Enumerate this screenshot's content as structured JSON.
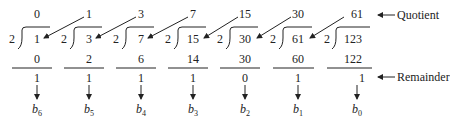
{
  "divisor": "2",
  "columns": [
    {
      "quotient": "0",
      "dividend": "1",
      "product": "0",
      "remainder": "1",
      "bit": "b",
      "bit_sub": "6"
    },
    {
      "quotient": "1",
      "dividend": "3",
      "product": "2",
      "remainder": "1",
      "bit": "b",
      "bit_sub": "5"
    },
    {
      "quotient": "3",
      "dividend": "7",
      "product": "6",
      "remainder": "1",
      "bit": "b",
      "bit_sub": "4"
    },
    {
      "quotient": "7",
      "dividend": "15",
      "product": "14",
      "remainder": "1",
      "bit": "b",
      "bit_sub": "3"
    },
    {
      "quotient": "15",
      "dividend": "30",
      "product": "30",
      "remainder": "0",
      "bit": "b",
      "bit_sub": "2"
    },
    {
      "quotient": "30",
      "dividend": "61",
      "product": "60",
      "remainder": "1",
      "bit": "b",
      "bit_sub": "1"
    },
    {
      "quotient": "61",
      "dividend": "123",
      "product": "122",
      "remainder": "1",
      "bit": "b",
      "bit_sub": "0"
    }
  ],
  "labels": {
    "quotient": "Quotient",
    "remainder": "Remainder"
  },
  "colors": {
    "ink": "#222222",
    "background": "#ffffff"
  }
}
